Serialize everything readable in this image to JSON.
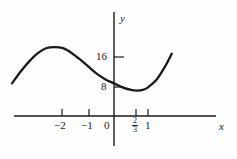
{
  "figure": {
    "background_color": "#fdfdfd",
    "ink_color": "#1a1a1a"
  },
  "axes": {
    "x_name": "x",
    "y_name": "y",
    "origin_label": "0"
  },
  "labels": {
    "x_minus_2": "−2",
    "x_minus_1": "−1",
    "x_zero": "0",
    "x_two_thirds_numerator": "2",
    "x_two_thirds_denominator": "3",
    "x_one": "1",
    "y_eight": "8",
    "y_sixteen": "16"
  },
  "chart_data": {
    "type": "line",
    "title": "",
    "xlabel": "x",
    "ylabel": "y",
    "xlim": [
      -3.2,
      2.0
    ],
    "ylim": [
      -4,
      30
    ],
    "grid": false,
    "legend": null,
    "x_ticks": [
      -2,
      -1,
      0,
      0.6667,
      1
    ],
    "x_tick_labels": [
      "−2",
      "−1",
      "0",
      "2/3",
      "1"
    ],
    "y_ticks": [
      8,
      16
    ],
    "y_tick_labels": [
      "8",
      "16"
    ],
    "features": {
      "local_maximum": {
        "x": -1.7,
        "y": 19
      },
      "local_minimum": {
        "x": 0.6667,
        "y": 7
      },
      "y_intercept": {
        "x": 0,
        "y": 9
      }
    },
    "series": [
      {
        "name": "curve",
        "color": "#1a1a1a",
        "x": [
          -3.0,
          -2.75,
          -2.5,
          -2.25,
          -2.0,
          -1.75,
          -1.5,
          -1.25,
          -1.0,
          -0.75,
          -0.5,
          -0.25,
          0.0,
          0.25,
          0.5,
          0.6667,
          0.85,
          1.0,
          1.25,
          1.5,
          1.7
        ],
        "y": [
          9.0,
          12.2,
          15.0,
          17.3,
          18.7,
          19.0,
          18.7,
          17.4,
          15.6,
          13.6,
          11.6,
          10.1,
          9.0,
          7.9,
          7.2,
          7.0,
          7.2,
          7.9,
          10.0,
          13.6,
          17.2
        ]
      }
    ]
  }
}
